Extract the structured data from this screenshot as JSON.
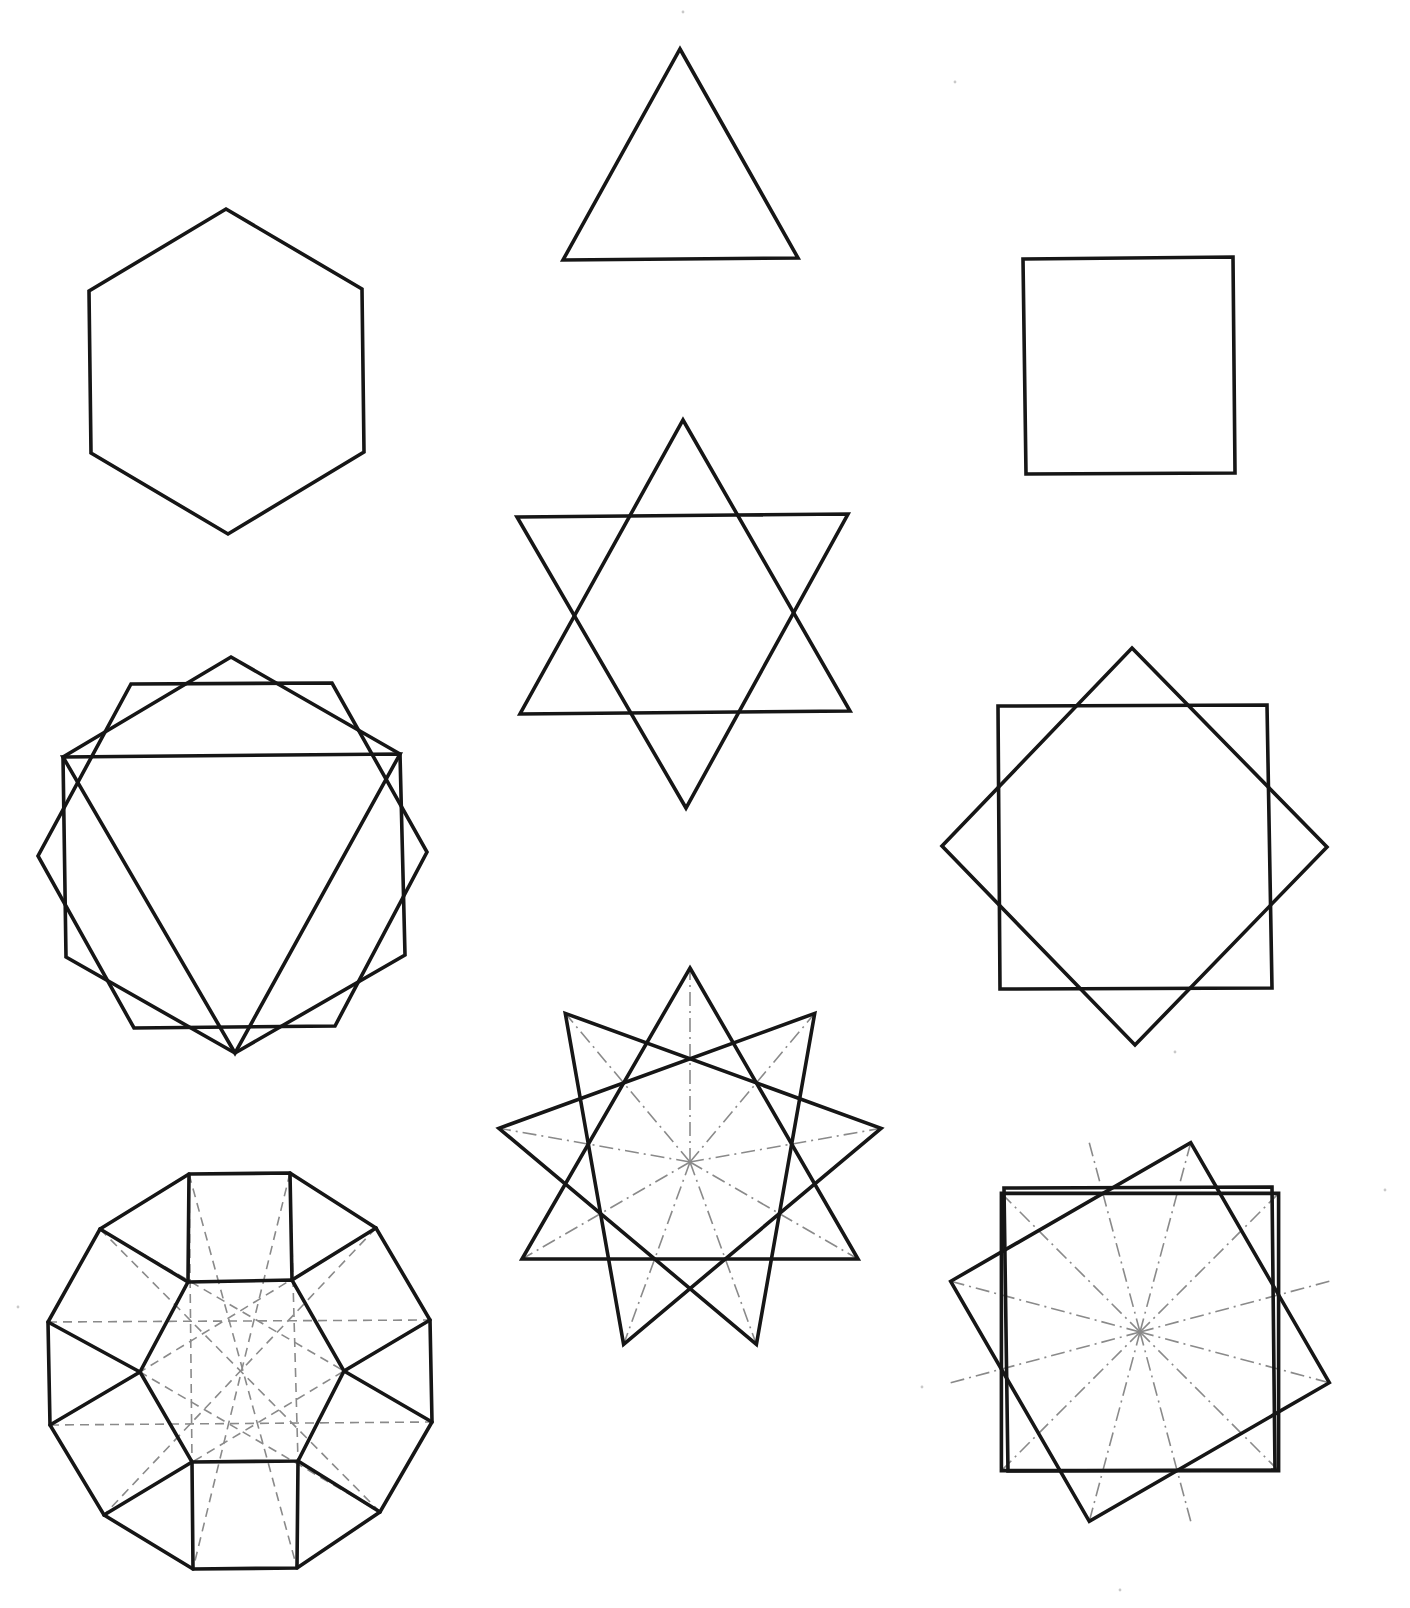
{
  "page": {
    "background": "#ffffff",
    "line_color": "#161616",
    "guide_color": "#8a8a8a"
  },
  "figures": [
    {
      "id": "triangle",
      "name": "Equilateral triangle",
      "description": "single regular triangle, point up"
    },
    {
      "id": "hexagon",
      "name": "Regular hexagon",
      "description": "single regular hexagon, pointy top"
    },
    {
      "id": "square",
      "name": "Square",
      "description": "single square, axis aligned"
    },
    {
      "id": "hexagram",
      "name": "Hexagram {6/2}",
      "description": "two overlapping equilateral triangles"
    },
    {
      "id": "hexagons-triangle",
      "name": "Two hexagons with inscribed triangle",
      "description": "pointy-top hexagon, flat-top hexagon and downward triangle superimposed"
    },
    {
      "id": "octagram",
      "name": "Octagram {8/2}",
      "description": "square and 45-degree rotated square"
    },
    {
      "id": "dodecagon-hexagon",
      "name": "Dodecagon with inner hexagon",
      "description": "12-gon subdivided into squares and triangles around a central hexagon, dashed construction lines",
      "guides": "dashed"
    },
    {
      "id": "enneagram",
      "name": "Enneagram {9/3}",
      "description": "three overlapping equilateral triangles with dash-dot radii",
      "guides": "dash-dot"
    },
    {
      "id": "dodecagram",
      "name": "Dodecagram {12/3}",
      "description": "three overlapping squares with dash-dot radii",
      "guides": "dash-dot"
    }
  ]
}
